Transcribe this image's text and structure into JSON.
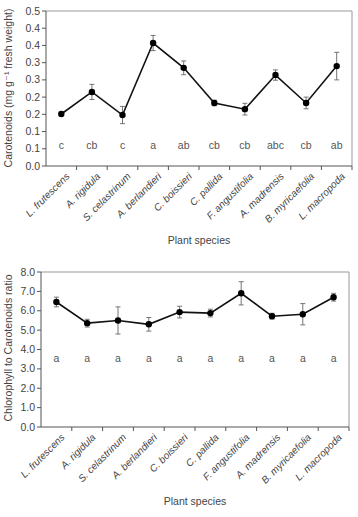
{
  "chart_data": [
    {
      "type": "line",
      "title": "",
      "xlabel": "Plant species",
      "ylabel": "Carotenoids (mg g⁻¹ fresh weight)",
      "ylim": [
        0,
        0.45
      ],
      "y_ticks": [
        0.0,
        0.05,
        0.1,
        0.15,
        0.2,
        0.25,
        0.3,
        0.35,
        0.4,
        0.45
      ],
      "y_tick_labels": [
        "0.0",
        "0.1",
        "0.1",
        "0.2",
        "0.2",
        "0.3",
        "0.3",
        "0.4",
        "0.4",
        "0.5"
      ],
      "grid": false,
      "categories": [
        "L. frutescens",
        "A. rigidula",
        "S. celastrinum",
        "A. berlandieri",
        "C. boissieri",
        "C. pallida",
        "F. angustifolia",
        "A. madrensis",
        "B. myricaefolia",
        "L. macropoda"
      ],
      "values": [
        0.151,
        0.215,
        0.148,
        0.357,
        0.285,
        0.183,
        0.165,
        0.264,
        0.183,
        0.29
      ],
      "errors": [
        0.005,
        0.022,
        0.025,
        0.022,
        0.02,
        0.008,
        0.017,
        0.015,
        0.017,
        0.04
      ],
      "group_letters": [
        "c",
        "cb",
        "c",
        "a",
        "ab",
        "cb",
        "cb",
        "abc",
        "cb",
        "ab"
      ]
    },
    {
      "type": "line",
      "title": "",
      "xlabel": "Plant species",
      "ylabel": "Chlorophyll to Carotenoids ratio",
      "ylim": [
        0,
        8.0
      ],
      "y_ticks": [
        0.0,
        1.0,
        2.0,
        3.0,
        4.0,
        5.0,
        6.0,
        7.0,
        8.0
      ],
      "y_tick_labels": [
        "0.0",
        "1.0",
        "2.0",
        "3.0",
        "4.0",
        "5.0",
        "6.0",
        "7.0",
        "8.0"
      ],
      "grid": false,
      "categories": [
        "L. frutescens",
        "A. rigidula",
        "S. celastrinum",
        "A. berlandieri",
        "C. boissieri",
        "C. pallida",
        "F. angustifolia",
        "A. madrensis",
        "B. myricaefolia",
        "L. macropoda"
      ],
      "values": [
        6.45,
        5.36,
        5.5,
        5.3,
        5.93,
        5.88,
        6.9,
        5.72,
        5.82,
        6.7
      ],
      "errors": [
        0.25,
        0.2,
        0.7,
        0.35,
        0.3,
        0.2,
        0.6,
        0.15,
        0.55,
        0.2
      ],
      "group_letters": [
        "a",
        "a",
        "a",
        "a",
        "a",
        "a",
        "a",
        "a",
        "a",
        "a"
      ]
    }
  ]
}
